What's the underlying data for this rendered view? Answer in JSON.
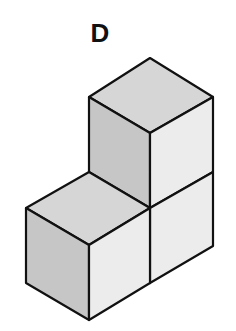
{
  "figure": {
    "label": "D",
    "colors": {
      "top_face": "#d6d6d6",
      "left_face": "#c6c6c6",
      "right_face": "#ececec",
      "edge": "#111111",
      "background": "#ffffff"
    },
    "cubes": [
      {
        "name": "top-cube",
        "position": "upper right"
      },
      {
        "name": "bottom-right-cube",
        "position": "lower right"
      },
      {
        "name": "bottom-left-cube",
        "position": "lower left, front"
      }
    ]
  }
}
